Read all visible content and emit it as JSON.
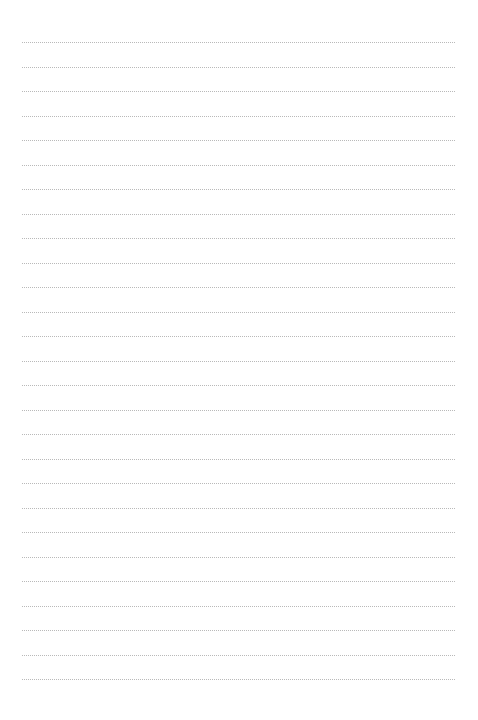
{
  "page": {
    "type": "blank lined notebook page",
    "line_count": 27,
    "line_start_y": 42,
    "line_spacing": 24.5,
    "line_left": 22,
    "line_width": 433,
    "line_color": "#b9b9b9",
    "background_color": "#ffffff"
  }
}
